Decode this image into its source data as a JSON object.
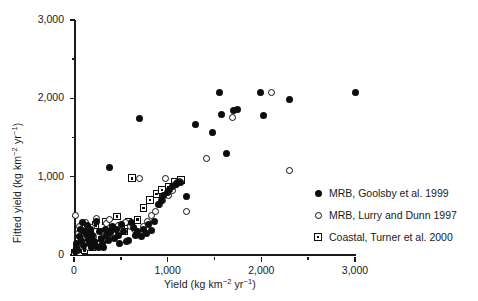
{
  "chart_data": {
    "type": "scatter",
    "title": "",
    "xlabel": "Yield (kg km⁻² yr⁻¹)",
    "ylabel": "Fitted yield (kg km⁻² yr⁻¹)",
    "xlim": [
      0,
      3000
    ],
    "ylim": [
      0,
      3000
    ],
    "grid": false,
    "legend_position": "right-lower",
    "x_major_ticks": [
      0,
      1000,
      2000,
      3000
    ],
    "x_minor_ticks": [
      500,
      1500,
      2500
    ],
    "y_major_ticks": [
      0,
      1000,
      2000,
      3000
    ],
    "y_minor_ticks": [
      500,
      1500,
      2500
    ],
    "x_tick_labels": [
      "0",
      "1,000",
      "2,000",
      "3,000"
    ],
    "y_tick_labels": [
      "0",
      "1,000",
      "2,000",
      "3,000"
    ],
    "series": [
      {
        "name": "MRB, Goolsby et al. 1999",
        "marker": "filled-circle",
        "color": "#0d0d0d",
        "points": [
          [
            20,
            40
          ],
          [
            25,
            95
          ],
          [
            30,
            150
          ],
          [
            40,
            60
          ],
          [
            55,
            230
          ],
          [
            70,
            330
          ],
          [
            80,
            180
          ],
          [
            95,
            420
          ],
          [
            100,
            120
          ],
          [
            110,
            300
          ],
          [
            130,
            260
          ],
          [
            140,
            380
          ],
          [
            150,
            200
          ],
          [
            165,
            150
          ],
          [
            175,
            330
          ],
          [
            185,
            90
          ],
          [
            200,
            250
          ],
          [
            215,
            170
          ],
          [
            230,
            120
          ],
          [
            245,
            430
          ],
          [
            260,
            95
          ],
          [
            275,
            300
          ],
          [
            290,
            210
          ],
          [
            305,
            150
          ],
          [
            320,
            100
          ],
          [
            335,
            330
          ],
          [
            350,
            250
          ],
          [
            365,
            180
          ],
          [
            380,
            1120
          ],
          [
            395,
            290
          ],
          [
            415,
            370
          ],
          [
            430,
            210
          ],
          [
            450,
            330
          ],
          [
            470,
            250
          ],
          [
            490,
            150
          ],
          [
            510,
            390
          ],
          [
            530,
            300
          ],
          [
            560,
            170
          ],
          [
            585,
            190
          ],
          [
            610,
            420
          ],
          [
            640,
            350
          ],
          [
            660,
            250
          ],
          [
            680,
            300
          ],
          [
            700,
            1740
          ],
          [
            720,
            240
          ],
          [
            745,
            330
          ],
          [
            770,
            270
          ],
          [
            800,
            390
          ],
          [
            830,
            310
          ],
          [
            860,
            430
          ],
          [
            900,
            640
          ],
          [
            930,
            700
          ],
          [
            960,
            760
          ],
          [
            1000,
            800
          ],
          [
            1020,
            830
          ],
          [
            1050,
            870
          ],
          [
            1080,
            900
          ],
          [
            1100,
            930
          ],
          [
            1140,
            930
          ],
          [
            1200,
            750
          ],
          [
            1300,
            1660
          ],
          [
            1480,
            1560
          ],
          [
            1550,
            2080
          ],
          [
            1580,
            1790
          ],
          [
            1630,
            1300
          ],
          [
            1700,
            1850
          ],
          [
            1750,
            1860
          ],
          [
            1990,
            2080
          ],
          [
            2020,
            1780
          ],
          [
            2300,
            1980
          ],
          [
            3000,
            2080
          ]
        ]
      },
      {
        "name": "MRB, Lurry and Dunn 1997",
        "marker": "open-circle",
        "color": "#0d0d0d",
        "points": [
          [
            15,
            60
          ],
          [
            20,
            500
          ],
          [
            30,
            140
          ],
          [
            45,
            270
          ],
          [
            60,
            370
          ],
          [
            75,
            110
          ],
          [
            90,
            310
          ],
          [
            105,
            200
          ],
          [
            120,
            420
          ],
          [
            140,
            160
          ],
          [
            160,
            90
          ],
          [
            185,
            350
          ],
          [
            210,
            240
          ],
          [
            235,
            470
          ],
          [
            260,
            140
          ],
          [
            290,
            300
          ],
          [
            320,
            200
          ],
          [
            350,
            400
          ],
          [
            380,
            450
          ],
          [
            410,
            280
          ],
          [
            440,
            340
          ],
          [
            470,
            380
          ],
          [
            510,
            300
          ],
          [
            550,
            420
          ],
          [
            600,
            370
          ],
          [
            650,
            330
          ],
          [
            700,
            980
          ],
          [
            740,
            360
          ],
          [
            790,
            430
          ],
          [
            830,
            500
          ],
          [
            870,
            560
          ],
          [
            910,
            640
          ],
          [
            950,
            700
          ],
          [
            980,
            980
          ],
          [
            1010,
            760
          ],
          [
            1050,
            820
          ],
          [
            1090,
            900
          ],
          [
            1130,
            940
          ],
          [
            1200,
            560
          ],
          [
            1410,
            1230
          ],
          [
            1690,
            1760
          ],
          [
            2110,
            2080
          ],
          [
            2300,
            1080
          ]
        ]
      },
      {
        "name": "Coastal, Turner et al. 2000",
        "marker": "dotted-square",
        "color": "#0d0d0d",
        "points": [
          [
            10,
            30
          ],
          [
            25,
            50
          ],
          [
            40,
            70
          ],
          [
            60,
            40
          ],
          [
            85,
            90
          ],
          [
            110,
            60
          ],
          [
            140,
            120
          ],
          [
            170,
            330
          ],
          [
            200,
            100
          ],
          [
            230,
            380
          ],
          [
            265,
            150
          ],
          [
            300,
            200
          ],
          [
            340,
            430
          ],
          [
            380,
            330
          ],
          [
            420,
            250
          ],
          [
            460,
            490
          ],
          [
            500,
            370
          ],
          [
            540,
            300
          ],
          [
            580,
            420
          ],
          [
            620,
            980
          ],
          [
            680,
            450
          ],
          [
            740,
            600
          ],
          [
            810,
            700
          ],
          [
            880,
            780
          ],
          [
            940,
            830
          ],
          [
            1010,
            870
          ],
          [
            1080,
            930
          ],
          [
            1140,
            960
          ]
        ]
      }
    ]
  },
  "legend": {
    "items": [
      {
        "label": "MRB, Goolsby et al. 1999",
        "marker": "filled-circle"
      },
      {
        "label": "MRB, Lurry and Dunn 1997",
        "marker": "open-circle"
      },
      {
        "label": "Coastal, Turner et al. 2000",
        "marker": "dotted-square"
      }
    ]
  }
}
